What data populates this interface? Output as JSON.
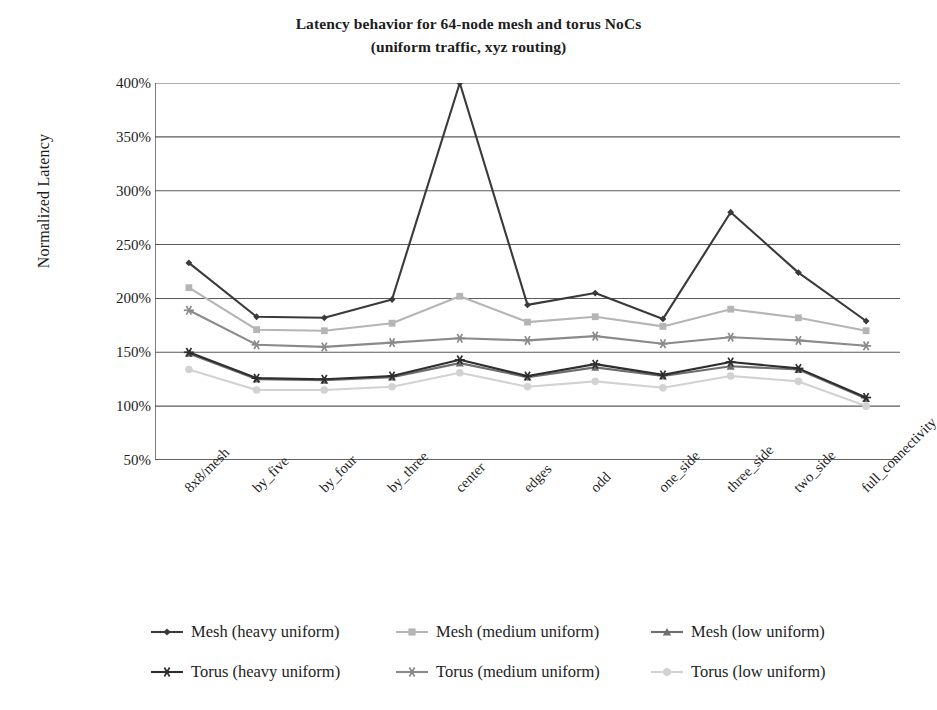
{
  "chart_data": {
    "type": "line",
    "title": "Latency behavior for 64-node mesh and torus NoCs",
    "subtitle": "(uniform traffic, xyz routing)",
    "xlabel": "",
    "ylabel": "Normalized Latency",
    "ylim": [
      50,
      400
    ],
    "ytick_labels": [
      "400%",
      "350%",
      "300%",
      "250%",
      "200%",
      "150%",
      "100%",
      "50%"
    ],
    "ytick_values": [
      400,
      350,
      300,
      250,
      200,
      150,
      100,
      50
    ],
    "grid": true,
    "legend_position": "bottom",
    "categories": [
      "8x8/mesh",
      "by_five",
      "by_four",
      "by_three",
      "center",
      "edges",
      "odd",
      "one_side",
      "three_side",
      "two_side",
      "full_connectivity"
    ],
    "series": [
      {
        "name": "Mesh (heavy uniform)",
        "marker": "diamond",
        "color": "#3a3a3a",
        "values": [
          233,
          183,
          182,
          199,
          400,
          194,
          205,
          181,
          280,
          224,
          179
        ]
      },
      {
        "name": "Mesh (medium uniform)",
        "marker": "square",
        "color": "#b5b5b5",
        "values": [
          210,
          171,
          170,
          177,
          202,
          178,
          183,
          174,
          190,
          182,
          170
        ]
      },
      {
        "name": "Mesh (low uniform)",
        "marker": "triangle",
        "color": "#6e6e6e",
        "values": [
          149,
          125,
          124,
          127,
          140,
          127,
          136,
          128,
          137,
          134,
          107
        ]
      },
      {
        "name": "Torus (heavy uniform)",
        "marker": "star",
        "color": "#2e2e2e",
        "values": [
          150,
          126,
          125,
          128,
          143,
          128,
          139,
          129,
          141,
          135,
          108
        ]
      },
      {
        "name": "Torus (medium uniform)",
        "marker": "asterisk",
        "color": "#8a8a8a",
        "values": [
          189,
          157,
          155,
          159,
          163,
          161,
          165,
          158,
          164,
          161,
          156
        ]
      },
      {
        "name": "Torus (low uniform)",
        "marker": "circle",
        "color": "#d2d2d2",
        "values": [
          134,
          115,
          115,
          118,
          131,
          118,
          123,
          117,
          128,
          123,
          100
        ]
      }
    ]
  },
  "legend": {
    "items": [
      "Mesh (heavy uniform)",
      "Mesh (medium uniform)",
      "Mesh (low uniform)",
      "Torus (heavy uniform)",
      "Torus (medium uniform)",
      "Torus (low uniform)"
    ]
  },
  "axis": {
    "line_color": "#4a4a4a",
    "grid_color": "#5a5a5a"
  }
}
